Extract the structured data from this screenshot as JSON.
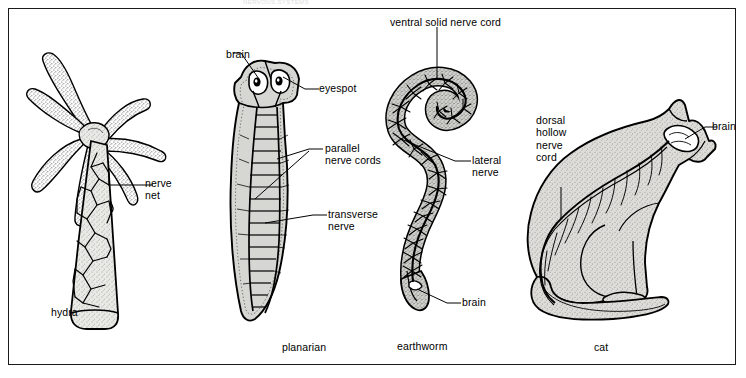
{
  "figure": {
    "running_header": "NERVOUS  SYSTEMS",
    "background_color": "#ffffff",
    "frame_color": "#1a1a1a",
    "body_fill_color": "#d9d9d6",
    "ink_color": "#000000"
  },
  "panels": [
    {
      "id": "hydra",
      "organism_label": "hydra",
      "callouts": [
        {
          "id": "nerve-net",
          "text": "nerve\nnet",
          "lines": [
            "nerve",
            "net"
          ]
        }
      ]
    },
    {
      "id": "planarian",
      "organism_label": "planarian",
      "callouts": [
        {
          "id": "brain",
          "text": "brain",
          "lines": [
            "brain"
          ]
        },
        {
          "id": "eyespot",
          "text": "eyespot",
          "lines": [
            "eyespot"
          ]
        },
        {
          "id": "parallel-nerve-cords",
          "text": "parallel\nnerve cords",
          "lines": [
            "parallel",
            "nerve cords"
          ]
        },
        {
          "id": "transverse-nerve",
          "text": "transverse\nnerve",
          "lines": [
            "transverse",
            "nerve"
          ]
        }
      ]
    },
    {
      "id": "earthworm",
      "organism_label": "earthworm",
      "callouts": [
        {
          "id": "ventral-solid-nerve-cord",
          "text": "ventral solid nerve cord",
          "lines": [
            "ventral solid nerve cord"
          ]
        },
        {
          "id": "lateral-nerve",
          "text": "lateral\nnerve",
          "lines": [
            "lateral",
            "nerve"
          ]
        },
        {
          "id": "brain",
          "text": "brain",
          "lines": [
            "brain"
          ]
        }
      ]
    },
    {
      "id": "cat",
      "organism_label": "cat",
      "callouts": [
        {
          "id": "dorsal-hollow-nerve-cord",
          "text": "dorsal\nhollow\nnerve\ncord",
          "lines": [
            "dorsal",
            "hollow",
            "nerve",
            "cord"
          ]
        },
        {
          "id": "brain",
          "text": "brain",
          "lines": [
            "brain"
          ]
        }
      ]
    }
  ]
}
